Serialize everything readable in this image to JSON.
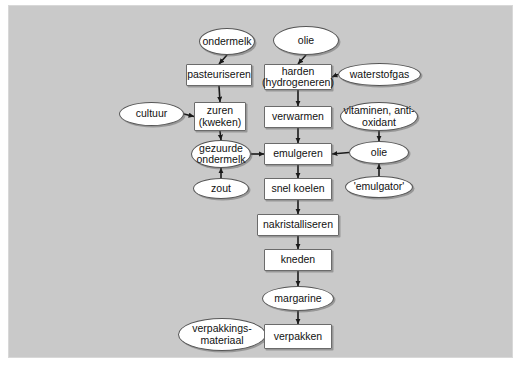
{
  "diagram": {
    "background_color": "#c9c9c9",
    "node_fill": "#ffffff",
    "node_border": "#6b6b6b",
    "text_color": "#111111",
    "nodes": [
      {
        "id": "ondermelk",
        "label": "ondermelk",
        "shape": "ellipse",
        "x": 190,
        "y": 22,
        "w": 56,
        "h": 27
      },
      {
        "id": "olie_top",
        "label": "olie",
        "shape": "ellipse",
        "x": 264,
        "y": 20,
        "w": 66,
        "h": 29
      },
      {
        "id": "pasteuriseren",
        "label": "pasteuriseren",
        "shape": "box",
        "x": 177,
        "y": 58,
        "w": 66,
        "h": 22
      },
      {
        "id": "harden",
        "label": "harden (hydrogeneren)",
        "shape": "box",
        "x": 255,
        "y": 58,
        "w": 68,
        "h": 26
      },
      {
        "id": "waterstofgas",
        "label": "waterstofgas",
        "shape": "ellipse",
        "x": 329,
        "y": 57,
        "w": 83,
        "h": 23
      },
      {
        "id": "cultuur",
        "label": "cultuur",
        "shape": "ellipse",
        "x": 110,
        "y": 96,
        "w": 65,
        "h": 24
      },
      {
        "id": "zuren",
        "label": "zuren (kweken)",
        "shape": "box",
        "x": 185,
        "y": 96,
        "w": 52,
        "h": 29
      },
      {
        "id": "verwarmen",
        "label": "verwarmen",
        "shape": "box",
        "x": 255,
        "y": 100,
        "w": 68,
        "h": 22
      },
      {
        "id": "vitaminen",
        "label": "vitaminen, anti-oxidant",
        "shape": "ellipse",
        "x": 331,
        "y": 96,
        "w": 78,
        "h": 29
      },
      {
        "id": "gezuurde",
        "label": "gezuurde ondermelk",
        "shape": "ellipse",
        "x": 182,
        "y": 134,
        "w": 60,
        "h": 28
      },
      {
        "id": "emulgeren",
        "label": "emulgeren",
        "shape": "box",
        "x": 255,
        "y": 137,
        "w": 68,
        "h": 22
      },
      {
        "id": "olie_right",
        "label": "olie",
        "shape": "ellipse",
        "x": 340,
        "y": 135,
        "w": 60,
        "h": 23
      },
      {
        "id": "zout",
        "label": "zout",
        "shape": "ellipse",
        "x": 184,
        "y": 172,
        "w": 56,
        "h": 21
      },
      {
        "id": "snel_koelen",
        "label": "snel koelen",
        "shape": "box",
        "x": 255,
        "y": 172,
        "w": 68,
        "h": 22
      },
      {
        "id": "emulgator",
        "label": "'emulgator'",
        "shape": "ellipse",
        "x": 336,
        "y": 170,
        "w": 68,
        "h": 22
      },
      {
        "id": "nakristalliseren",
        "label": "nakristalliseren",
        "shape": "box",
        "x": 248,
        "y": 208,
        "w": 82,
        "h": 22
      },
      {
        "id": "kneden",
        "label": "kneden",
        "shape": "box",
        "x": 255,
        "y": 243,
        "w": 68,
        "h": 22
      },
      {
        "id": "margarine",
        "label": "margarine",
        "shape": "ellipse",
        "x": 253,
        "y": 280,
        "w": 72,
        "h": 25
      },
      {
        "id": "verpakkingsmateriaal",
        "label": "verpakkings- materiaal",
        "shape": "ellipse",
        "x": 169,
        "y": 312,
        "w": 88,
        "h": 33
      },
      {
        "id": "verpakken",
        "label": "verpakken",
        "shape": "box",
        "x": 255,
        "y": 318,
        "w": 68,
        "h": 25
      }
    ],
    "edges": [
      {
        "from": "ondermelk",
        "to": "pasteuriseren",
        "dir": "down"
      },
      {
        "from": "pasteuriseren",
        "to": "zuren",
        "dir": "down"
      },
      {
        "from": "cultuur",
        "to": "zuren",
        "dir": "right"
      },
      {
        "from": "zuren",
        "to": "gezuurde",
        "dir": "down"
      },
      {
        "from": "zout",
        "to": "gezuurde",
        "dir": "up"
      },
      {
        "from": "gezuurde",
        "to": "emulgeren",
        "dir": "right"
      },
      {
        "from": "olie_top",
        "to": "harden",
        "dir": "down"
      },
      {
        "from": "waterstofgas",
        "to": "harden",
        "dir": "left"
      },
      {
        "from": "harden",
        "to": "verwarmen",
        "dir": "down"
      },
      {
        "from": "verwarmen",
        "to": "emulgeren",
        "dir": "down"
      },
      {
        "from": "vitaminen",
        "to": "olie_right",
        "dir": "down"
      },
      {
        "from": "emulgator",
        "to": "olie_right",
        "dir": "up"
      },
      {
        "from": "olie_right",
        "to": "emulgeren",
        "dir": "left"
      },
      {
        "from": "emulgeren",
        "to": "snel_koelen",
        "dir": "down"
      },
      {
        "from": "snel_koelen",
        "to": "nakristalliseren",
        "dir": "down"
      },
      {
        "from": "nakristalliseren",
        "to": "kneden",
        "dir": "down"
      },
      {
        "from": "kneden",
        "to": "margarine",
        "dir": "down"
      },
      {
        "from": "margarine",
        "to": "verpakken",
        "dir": "down"
      },
      {
        "from": "verpakkingsmateriaal",
        "to": "verpakken",
        "dir": "right"
      }
    ]
  }
}
